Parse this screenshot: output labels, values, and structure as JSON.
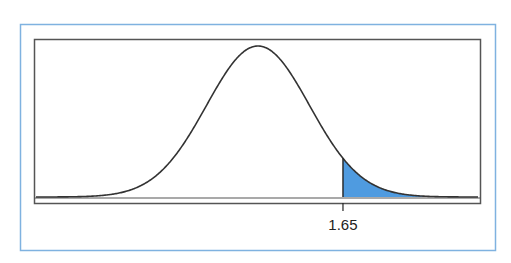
{
  "chart_data": {
    "type": "area",
    "title": "",
    "distribution": {
      "name": "normal",
      "mean": 0,
      "sd": 1
    },
    "shaded_region": {
      "from": 1.65,
      "to": "inf",
      "side": "right"
    },
    "x_ticks": [
      {
        "value": 1.65,
        "label": "1.65"
      }
    ],
    "xlabel": "",
    "ylabel": "",
    "grid": false,
    "legend": null
  },
  "colors": {
    "frame": "#7fb2e0",
    "box": "#555555",
    "curve": "#333333",
    "fill": "#4f9be0"
  },
  "labels": {
    "critical_value": "1.65"
  }
}
